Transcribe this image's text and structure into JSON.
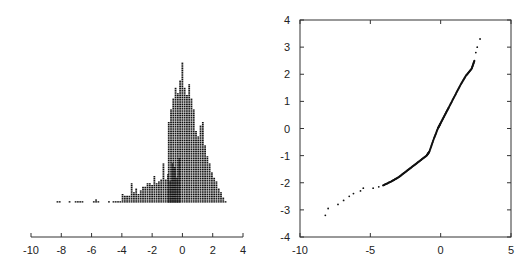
{
  "chart_data": [
    {
      "type": "bar",
      "subtype": "dot-histogram",
      "title": "",
      "xlabel": "",
      "ylabel": "",
      "xlim": [
        -10,
        4
      ],
      "xticks": [
        -10,
        -8,
        -6,
        -4,
        -2,
        0,
        2,
        4
      ],
      "xtick_labels": [
        "-10",
        "-8",
        "-6",
        "-4",
        "-2",
        "0",
        "2",
        "4"
      ],
      "grid": false,
      "bin_width": 0.15,
      "bins": [
        [
          -8.25,
          1
        ],
        [
          -8.1,
          1
        ],
        [
          -7.45,
          1
        ],
        [
          -7.05,
          1
        ],
        [
          -6.9,
          1
        ],
        [
          -6.75,
          1
        ],
        [
          -6.6,
          1
        ],
        [
          -5.85,
          1
        ],
        [
          -5.7,
          2
        ],
        [
          -5.55,
          1
        ],
        [
          -4.85,
          1
        ],
        [
          -4.55,
          1
        ],
        [
          -4.4,
          1
        ],
        [
          -4.25,
          1
        ],
        [
          -4.1,
          1
        ],
        [
          -3.95,
          5
        ],
        [
          -3.8,
          4
        ],
        [
          -3.65,
          4
        ],
        [
          -3.5,
          4
        ],
        [
          -3.35,
          11
        ],
        [
          -3.2,
          6
        ],
        [
          -3.05,
          8
        ],
        [
          -2.9,
          5
        ],
        [
          -2.75,
          7
        ],
        [
          -2.6,
          9
        ],
        [
          -2.45,
          9
        ],
        [
          -2.3,
          11
        ],
        [
          -2.15,
          11
        ],
        [
          -2.0,
          10
        ],
        [
          -1.85,
          15
        ],
        [
          -1.7,
          11
        ],
        [
          -1.55,
          12
        ],
        [
          -1.4,
          13
        ],
        [
          -1.25,
          22
        ],
        [
          -1.1,
          13
        ],
        [
          -0.95,
          16
        ],
        [
          -0.8,
          12
        ],
        [
          -0.65,
          22
        ],
        [
          -0.5,
          20
        ],
        [
          -0.35,
          14
        ],
        [
          -0.2,
          25
        ],
        [
          -1.0,
          0
        ],
        [
          -0.95,
          0
        ],
        [
          -0.9,
          45
        ],
        [
          -0.75,
          52
        ],
        [
          -0.6,
          58
        ],
        [
          -0.45,
          64
        ],
        [
          -0.3,
          61
        ],
        [
          -0.15,
          68
        ],
        [
          0.0,
          78
        ],
        [
          0.15,
          64
        ],
        [
          0.3,
          60
        ],
        [
          0.45,
          66
        ],
        [
          0.6,
          58
        ],
        [
          0.75,
          52
        ],
        [
          0.9,
          40
        ],
        [
          1.05,
          37
        ],
        [
          1.2,
          43
        ],
        [
          1.35,
          45
        ],
        [
          1.5,
          32
        ],
        [
          1.65,
          26
        ],
        [
          1.8,
          22
        ],
        [
          1.95,
          17
        ],
        [
          2.1,
          14
        ],
        [
          2.25,
          12
        ],
        [
          2.4,
          8
        ],
        [
          2.55,
          6
        ],
        [
          2.7,
          3
        ],
        [
          2.85,
          1
        ]
      ],
      "max_count": 78
    },
    {
      "type": "scatter",
      "subtype": "qq-plot",
      "title": "",
      "xlabel": "",
      "ylabel": "",
      "xlim": [
        -10,
        5
      ],
      "ylim": [
        -4,
        4
      ],
      "xticks": [
        -10,
        -5,
        0,
        5
      ],
      "xtick_labels": [
        "-10",
        "-5",
        "0",
        "5"
      ],
      "yticks": [
        -4,
        -3,
        -2,
        -1,
        0,
        1,
        2,
        3,
        4
      ],
      "ytick_labels": [
        "-4",
        "-3",
        "-2",
        "-1",
        "0",
        "1",
        "2",
        "3",
        "4"
      ],
      "grid": false,
      "points_description": "sample quantiles (x) vs theoretical normal quantiles (y); heavy left tail",
      "key_points": [
        [
          -8.2,
          -3.2
        ],
        [
          -8.0,
          -2.95
        ],
        [
          -7.3,
          -2.8
        ],
        [
          -6.9,
          -2.65
        ],
        [
          -6.5,
          -2.5
        ],
        [
          -6.2,
          -2.4
        ],
        [
          -5.7,
          -2.3
        ],
        [
          -5.5,
          -2.2
        ],
        [
          -4.8,
          -2.2
        ],
        [
          -4.4,
          -2.15
        ],
        [
          -4.1,
          -2.1
        ],
        [
          -3.5,
          -1.95
        ],
        [
          -3.0,
          -1.8
        ],
        [
          -2.5,
          -1.6
        ],
        [
          -2.0,
          -1.4
        ],
        [
          -1.5,
          -1.2
        ],
        [
          -1.0,
          -1.0
        ],
        [
          -0.8,
          -0.85
        ],
        [
          -0.5,
          -0.4
        ],
        [
          -0.2,
          0.0
        ],
        [
          0.0,
          0.2
        ],
        [
          0.3,
          0.5
        ],
        [
          0.6,
          0.8
        ],
        [
          1.0,
          1.2
        ],
        [
          1.4,
          1.6
        ],
        [
          1.8,
          1.95
        ],
        [
          2.2,
          2.2
        ],
        [
          2.4,
          2.5
        ],
        [
          2.5,
          2.8
        ],
        [
          2.6,
          3.0
        ],
        [
          2.8,
          3.3
        ]
      ]
    }
  ]
}
